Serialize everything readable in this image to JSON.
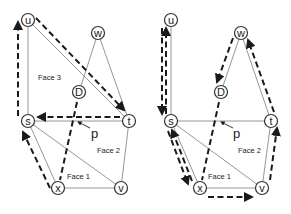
{
  "figure": {
    "panels": [
      {
        "id": "left",
        "vertices": {
          "u": "u",
          "w": "w",
          "D": "D",
          "s": "s",
          "t": "t",
          "x": "x",
          "v": "v"
        },
        "edges": [
          [
            "u",
            "s"
          ],
          [
            "u",
            "t"
          ],
          [
            "w",
            "D"
          ],
          [
            "w",
            "t"
          ],
          [
            "s",
            "t"
          ],
          [
            "s",
            "x"
          ],
          [
            "s",
            "v"
          ],
          [
            "x",
            "v"
          ],
          [
            "t",
            "v"
          ],
          [
            "D",
            "x"
          ]
        ],
        "dashed_paths": [
          [
            "s",
            "u"
          ],
          [
            "u",
            "t"
          ],
          [
            "t",
            "s"
          ],
          [
            "x",
            "s"
          ],
          [
            "D",
            "x"
          ]
        ],
        "faces": [
          "Face 3",
          "Face 2",
          "Face 1"
        ],
        "point_label": "p"
      },
      {
        "id": "right",
        "vertices": {
          "u": "u",
          "w": "w",
          "D": "D",
          "s": "s",
          "t": "t",
          "x": "x",
          "v": "v"
        },
        "edges": [
          [
            "u",
            "s"
          ],
          [
            "w",
            "D"
          ],
          [
            "w",
            "t"
          ],
          [
            "s",
            "t"
          ],
          [
            "s",
            "x"
          ],
          [
            "s",
            "v"
          ],
          [
            "x",
            "v"
          ],
          [
            "t",
            "v"
          ],
          [
            "D",
            "x"
          ]
        ],
        "dashed_paths": [
          [
            "u",
            "s"
          ],
          [
            "s",
            "u"
          ],
          [
            "s",
            "x"
          ],
          [
            "x",
            "s"
          ],
          [
            "x",
            "v"
          ],
          [
            "v",
            "t"
          ],
          [
            "t",
            "w"
          ],
          [
            "w",
            "D"
          ],
          [
            "D",
            "x"
          ]
        ],
        "faces": [
          "Face 2",
          "Face 1"
        ],
        "point_label": "p"
      }
    ]
  }
}
